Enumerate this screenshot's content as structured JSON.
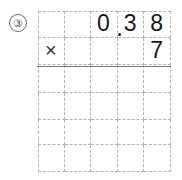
{
  "problem": {
    "number_label": "③",
    "expression": "0.38 × 7",
    "operator": "×"
  },
  "grid": {
    "columns": 5,
    "rows": 6,
    "column_width": 26.6,
    "row_height": 27,
    "line_style": "dashed",
    "line_color": "#b4b4b4",
    "rule_color": "#7a7a7a",
    "cells": [
      [
        "",
        "",
        "0",
        "3",
        "8"
      ],
      [
        "×",
        "",
        "",
        "",
        "7"
      ],
      [
        "",
        "",
        "",
        "",
        ""
      ],
      [
        "",
        "",
        "",
        "",
        ""
      ],
      [
        "",
        "",
        "",
        "",
        ""
      ],
      [
        "",
        "",
        "",
        "",
        ""
      ]
    ],
    "decimal_point": {
      "visible": true,
      "after_row": 0,
      "after_column": 2,
      "color": "#171717"
    },
    "answer_rule": {
      "visible": true,
      "below_row": 1
    }
  }
}
